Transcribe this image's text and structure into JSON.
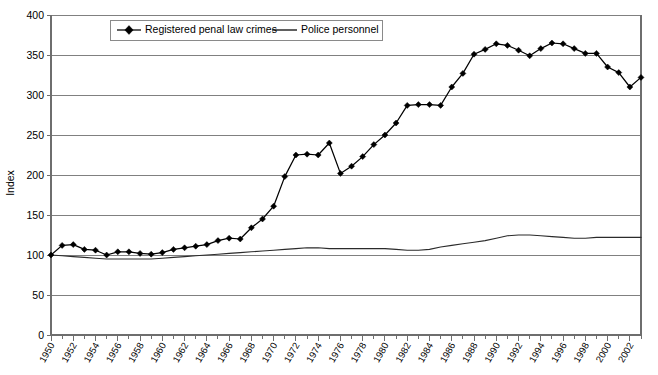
{
  "chart_data": {
    "type": "line",
    "title": "",
    "xlabel": "",
    "ylabel": "Index",
    "ylim": [
      0,
      400
    ],
    "ytick_step": 50,
    "yticks": [
      "0",
      "50",
      "100",
      "150",
      "200",
      "250",
      "300",
      "350",
      "400"
    ],
    "xlim": [
      1950,
      2003
    ],
    "xtick_step": 2,
    "grid": "horizontal",
    "legend_position": "top-left-inside",
    "x": [
      1950,
      1951,
      1952,
      1953,
      1954,
      1955,
      1956,
      1957,
      1958,
      1959,
      1960,
      1961,
      1962,
      1963,
      1964,
      1965,
      1966,
      1967,
      1968,
      1969,
      1970,
      1971,
      1972,
      1973,
      1974,
      1975,
      1976,
      1977,
      1978,
      1979,
      1980,
      1981,
      1982,
      1983,
      1984,
      1985,
      1986,
      1987,
      1988,
      1989,
      1990,
      1991,
      1992,
      1993,
      1994,
      1995,
      1996,
      1997,
      1998,
      1999,
      2000,
      2001,
      2002,
      2003
    ],
    "xticklabels": [
      "1950",
      "1952",
      "1954",
      "1956",
      "1958",
      "1960",
      "1962",
      "1964",
      "1966",
      "1968",
      "1970",
      "1972",
      "1974",
      "1976",
      "1978",
      "1980",
      "1982",
      "1984",
      "1986",
      "1988",
      "1990",
      "1992",
      "1994",
      "1996",
      "1998",
      "2000",
      "2002"
    ],
    "series": [
      {
        "name": "Registered penal law crimes",
        "marker": "diamond",
        "values": [
          100,
          112,
          113,
          107,
          106,
          100,
          104,
          104,
          102,
          101,
          103,
          107,
          109,
          111,
          113,
          118,
          121,
          120,
          134,
          145,
          161,
          198,
          225,
          226,
          225,
          240,
          202,
          211,
          223,
          238,
          250,
          265,
          287,
          288,
          288,
          287,
          310,
          327,
          351,
          357,
          364,
          362,
          356,
          349,
          358,
          365,
          364,
          358,
          352,
          352,
          335,
          328,
          310,
          322
        ]
      },
      {
        "name": "Police personnel",
        "marker": "none",
        "values": [
          100,
          99,
          98,
          97,
          96,
          95,
          95,
          95,
          95,
          95,
          96,
          97,
          98,
          99,
          100,
          101,
          102,
          103,
          104,
          105,
          106,
          107,
          108,
          109,
          109,
          108,
          108,
          108,
          108,
          108,
          108,
          107,
          106,
          106,
          107,
          110,
          112,
          114,
          116,
          118,
          121,
          124,
          125,
          125,
          124,
          123,
          122,
          121,
          121,
          122,
          122,
          122,
          122,
          122
        ]
      }
    ]
  },
  "legend": {
    "entries": [
      {
        "label": "Registered penal law crimes",
        "style": "line-with-diamond-marker",
        "color": "#000000"
      },
      {
        "label": "Police personnel",
        "style": "plain-line",
        "color": "#000000"
      }
    ]
  },
  "axes": {
    "y_title": "Index"
  },
  "colors": {
    "gridline": "#808080",
    "axis": "#6e6e6e",
    "series_primary": "#000000",
    "series_secondary": "#2b2b2b",
    "background": "#ffffff"
  }
}
